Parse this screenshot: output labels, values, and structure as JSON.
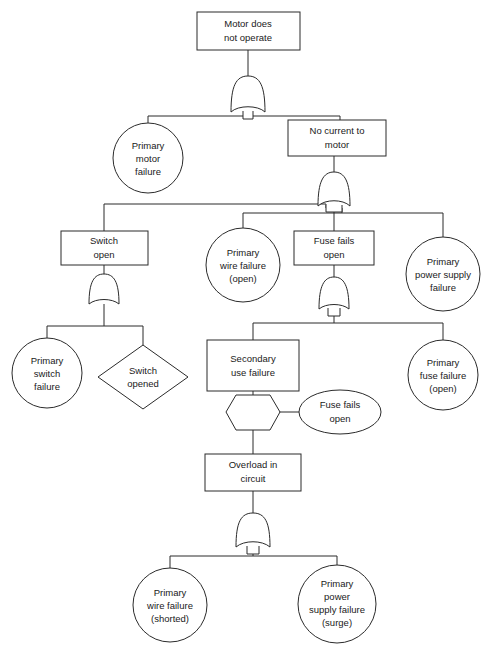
{
  "diagram": {
    "type": "fault-tree",
    "colors": {
      "background": "#ffffff",
      "stroke": "#2b2b2b",
      "text": "#1a1a1a"
    },
    "nodes": {
      "top_event": {
        "shape": "rect",
        "lines": [
          "Motor does",
          "not operate"
        ]
      },
      "primary_motor_failure": {
        "shape": "circle",
        "lines": [
          "Primary",
          "motor",
          "failure"
        ]
      },
      "no_current_to_motor": {
        "shape": "rect",
        "lines": [
          "No current  to",
          "motor"
        ]
      },
      "switch_open": {
        "shape": "rect",
        "lines": [
          "Switch",
          "open"
        ]
      },
      "primary_wire_failure_open": {
        "shape": "circle",
        "lines": [
          "Primary",
          "wire failure",
          "(open)"
        ]
      },
      "fuse_fails_open_box": {
        "shape": "rect",
        "lines": [
          "Fuse fails",
          "open"
        ]
      },
      "primary_power_supply_failure": {
        "shape": "circle",
        "lines": [
          "Primary",
          "power supply",
          "failure"
        ]
      },
      "primary_switch_failure": {
        "shape": "circle",
        "lines": [
          "Primary",
          "switch",
          "failure"
        ]
      },
      "switch_opened": {
        "shape": "diamond",
        "lines": [
          "Switch",
          "opened"
        ]
      },
      "secondary_use_failure": {
        "shape": "rect",
        "lines": [
          "Secondary",
          "use failure"
        ]
      },
      "fuse_fails_open_condition": {
        "shape": "ellipse",
        "lines": [
          "Fuse fails",
          "open"
        ]
      },
      "primary_fuse_failure_open": {
        "shape": "circle",
        "lines": [
          "Primary",
          "fuse failure",
          "(open)"
        ]
      },
      "overload_in_circuit": {
        "shape": "rect",
        "lines": [
          "Overload in",
          "circuit"
        ]
      },
      "primary_wire_failure_shorted": {
        "shape": "circle",
        "lines": [
          "Primary",
          "wire failure",
          "(shorted)"
        ]
      },
      "primary_power_supply_failure_surge": {
        "shape": "circle",
        "lines": [
          "Primary",
          "power",
          "supply failure",
          "(surge)"
        ]
      }
    },
    "gates": {
      "gate_top": {
        "type": "or"
      },
      "gate_no_current": {
        "type": "or"
      },
      "gate_switch_open": {
        "type": "or"
      },
      "gate_fuse_fails": {
        "type": "or"
      },
      "gate_inhibit": {
        "type": "inhibit"
      },
      "gate_overload": {
        "type": "or"
      }
    }
  }
}
